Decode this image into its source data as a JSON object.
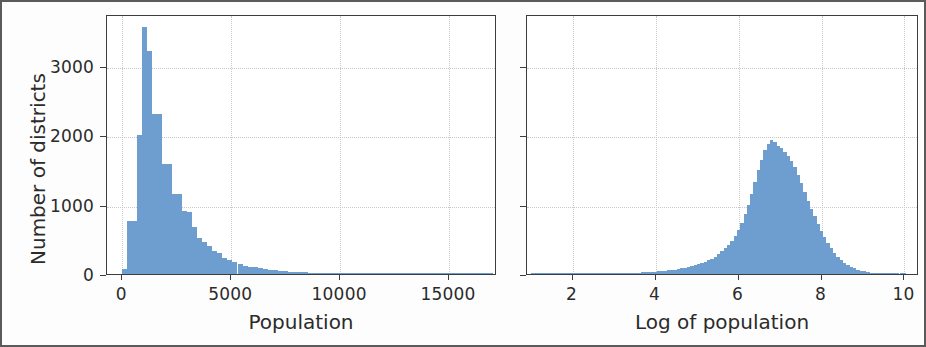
{
  "figure": {
    "background_color": "#fdfdfd",
    "border_color": "#5a5a5a",
    "bar_color": "#6e9ecf",
    "axis_color": "#3d3d3d",
    "grid_color": "#c9c9c9"
  },
  "chart_data": [
    {
      "type": "bar",
      "panel": "left",
      "title": "",
      "xlabel": "Population",
      "ylabel": "Number of districts",
      "xlim": [
        -700,
        17200
      ],
      "ylim": [
        0,
        3750
      ],
      "xticks": [
        0,
        5000,
        10000,
        15000
      ],
      "xticklabels": [
        "0",
        "5000",
        "10000",
        "15000"
      ],
      "yticks": [
        0,
        1000,
        2000,
        3000
      ],
      "yticklabels": [
        "0",
        "1000",
        "2000",
        "3000"
      ],
      "grid": true,
      "bin_width": 230,
      "bin_starts": [
        0,
        230,
        460,
        690,
        920,
        1150,
        1380,
        1610,
        1840,
        2070,
        2300,
        2530,
        2760,
        2990,
        3220,
        3450,
        3680,
        3910,
        4140,
        4370,
        4600,
        4830,
        5060,
        5290,
        5520,
        5750,
        5980,
        6210,
        6440,
        6670,
        6900,
        7130,
        7360,
        7590,
        7820,
        8050,
        8280,
        8510,
        8740,
        8970,
        9200,
        9430,
        9660,
        9890,
        10120,
        10350,
        10580,
        10810,
        11040,
        11270,
        11500,
        11730,
        11960,
        12190,
        12420,
        12650,
        12880,
        13110,
        13340,
        13570,
        13800,
        14030,
        14260,
        14490,
        14720,
        14950,
        15180,
        15410,
        15640,
        15870,
        16100,
        16330,
        16560,
        16790
      ],
      "values": [
        70,
        760,
        760,
        2000,
        3560,
        3220,
        2310,
        2310,
        1580,
        1580,
        1160,
        1160,
        910,
        900,
        680,
        520,
        460,
        400,
        330,
        300,
        230,
        200,
        170,
        150,
        120,
        105,
        95,
        80,
        70,
        62,
        55,
        48,
        42,
        36,
        30,
        26,
        22,
        20,
        17,
        15,
        13,
        11,
        10,
        9,
        8,
        7,
        6,
        6,
        5,
        5,
        4,
        4,
        4,
        3,
        3,
        3,
        3,
        2,
        2,
        2,
        2,
        2,
        2,
        2,
        1,
        1,
        1,
        1,
        1,
        1,
        1,
        1,
        1,
        1
      ]
    },
    {
      "type": "bar",
      "panel": "right",
      "title": "",
      "xlabel": "Log of population",
      "ylabel": "",
      "xlim": [
        0.9,
        10.35
      ],
      "ylim": [
        0,
        3750
      ],
      "xticks": [
        2,
        4,
        6,
        8,
        10
      ],
      "xticklabels": [
        "2",
        "4",
        "6",
        "8",
        "10"
      ],
      "yticks": [
        0,
        1000,
        2000,
        3000
      ],
      "yticklabels": [
        "",
        "",
        "",
        ""
      ],
      "grid": true,
      "bin_width": 0.08,
      "bin_starts": [
        1.0,
        1.08,
        1.16,
        1.24,
        1.32,
        1.4,
        1.48,
        1.56,
        1.64,
        1.72,
        1.8,
        1.88,
        1.96,
        2.04,
        2.12,
        2.2,
        2.28,
        2.36,
        2.44,
        2.52,
        2.6,
        2.68,
        2.76,
        2.84,
        2.92,
        3.0,
        3.08,
        3.16,
        3.24,
        3.32,
        3.4,
        3.48,
        3.56,
        3.64,
        3.72,
        3.8,
        3.88,
        3.96,
        4.04,
        4.12,
        4.2,
        4.28,
        4.36,
        4.44,
        4.52,
        4.6,
        4.68,
        4.76,
        4.84,
        4.92,
        5.0,
        5.08,
        5.16,
        5.24,
        5.32,
        5.4,
        5.48,
        5.56,
        5.64,
        5.72,
        5.8,
        5.88,
        5.96,
        6.04,
        6.12,
        6.2,
        6.28,
        6.36,
        6.44,
        6.52,
        6.6,
        6.68,
        6.76,
        6.84,
        6.92,
        7.0,
        7.08,
        7.16,
        7.24,
        7.32,
        7.4,
        7.48,
        7.56,
        7.64,
        7.72,
        7.8,
        7.88,
        7.96,
        8.04,
        8.12,
        8.2,
        8.28,
        8.36,
        8.44,
        8.52,
        8.6,
        8.68,
        8.76,
        8.84,
        8.92,
        9.0,
        9.08,
        9.16,
        9.24,
        9.32,
        9.4,
        9.48,
        9.56,
        9.64,
        9.72,
        9.8,
        9.88,
        9.96
      ],
      "values": [
        2,
        2,
        2,
        3,
        3,
        3,
        4,
        4,
        4,
        5,
        5,
        5,
        6,
        6,
        6,
        7,
        7,
        7,
        8,
        8,
        9,
        9,
        10,
        10,
        11,
        12,
        13,
        14,
        15,
        16,
        17,
        19,
        21,
        23,
        25,
        28,
        30,
        33,
        37,
        41,
        46,
        51,
        57,
        64,
        72,
        80,
        90,
        100,
        112,
        125,
        140,
        157,
        176,
        197,
        220,
        250,
        285,
        325,
        370,
        420,
        480,
        555,
        640,
        740,
        860,
        1000,
        1160,
        1330,
        1500,
        1650,
        1790,
        1880,
        1930,
        1900,
        1850,
        1820,
        1760,
        1700,
        1630,
        1540,
        1430,
        1310,
        1180,
        1060,
        940,
        830,
        720,
        620,
        530,
        450,
        375,
        310,
        250,
        200,
        160,
        128,
        102,
        80,
        62,
        48,
        37,
        28,
        21,
        16,
        12,
        9,
        7,
        5,
        4,
        3,
        2,
        2,
        1
      ]
    }
  ]
}
